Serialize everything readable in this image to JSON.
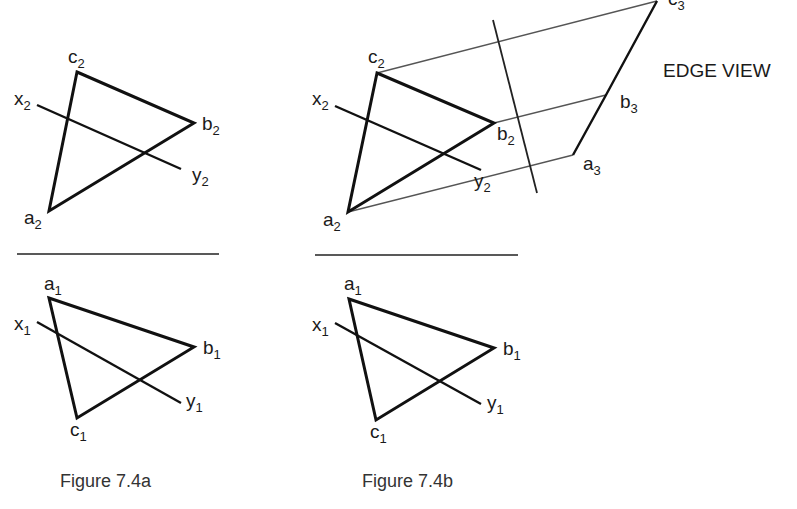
{
  "figure_a": {
    "caption": "Figure 7.4a",
    "top_view": {
      "points": {
        "a": "a",
        "b": "b",
        "c": "c",
        "x": "x",
        "y": "y"
      },
      "subscript": "2"
    },
    "bottom_view": {
      "points": {
        "a": "a",
        "b": "b",
        "c": "c",
        "x": "x",
        "y": "y"
      },
      "subscript": "1"
    }
  },
  "figure_b": {
    "caption": "Figure 7.4b",
    "top_view": {
      "points": {
        "a": "a",
        "b": "b",
        "c": "c",
        "x": "x",
        "y": "y"
      },
      "subscript": "2"
    },
    "bottom_view": {
      "points": {
        "a": "a",
        "b": "b",
        "c": "c",
        "x": "x",
        "y": "y"
      },
      "subscript": "1"
    },
    "auxiliary_view": {
      "points": {
        "a": "a",
        "b": "b",
        "c": "c"
      },
      "subscript": "3",
      "label": "EDGE VIEW"
    }
  }
}
